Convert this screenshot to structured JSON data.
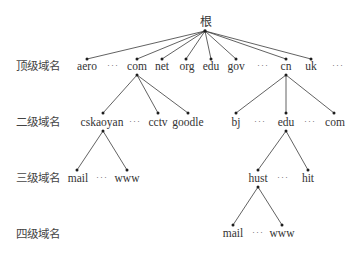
{
  "diagram": {
    "root": {
      "label": "根"
    },
    "level_labels": [
      "顶级域名",
      "二级域名",
      "三级域名",
      "四级域名"
    ],
    "ellipsis": "···",
    "top_level": {
      "nodes": [
        "aero",
        "com",
        "net",
        "org",
        "edu",
        "gov",
        "cn",
        "uk"
      ],
      "sequence": [
        "aero",
        "···",
        "com",
        "net",
        "org",
        "edu",
        "gov",
        "···",
        "cn",
        "uk",
        "···"
      ]
    },
    "second_level": {
      "com_children": [
        "cskaoyan",
        "cctv",
        "goodle"
      ],
      "com_sequence": [
        "cskaoyan",
        "···",
        "cctv",
        "goodle"
      ],
      "cn_children": [
        "bj",
        "edu",
        "com"
      ],
      "cn_sequence": [
        "bj",
        "···",
        "edu",
        "···",
        "com"
      ]
    },
    "third_level": {
      "cskaoyan_children": [
        "mail",
        "www"
      ],
      "cskaoyan_sequence": [
        "mail",
        "···",
        "www"
      ],
      "edu_children": [
        "hust",
        "hit"
      ],
      "edu_sequence": [
        "hust",
        "···",
        "hit"
      ]
    },
    "fourth_level": {
      "hust_children": [
        "mail",
        "www"
      ],
      "hust_sequence": [
        "mail",
        "···",
        "www"
      ]
    },
    "colors": {
      "line": "#3a3a3a",
      "text": "#333333",
      "background": "#ffffff"
    }
  }
}
